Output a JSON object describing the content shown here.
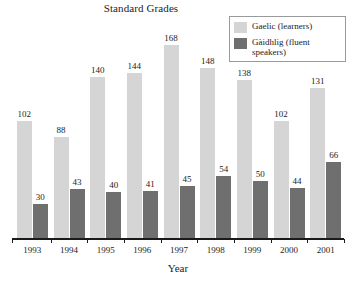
{
  "chart_data": {
    "type": "bar",
    "title": "Standard Grades",
    "xlabel": "Year",
    "ylabel": "",
    "categories": [
      "1993",
      "1994",
      "1995",
      "1996",
      "1997",
      "1998",
      "1999",
      "2000",
      "2001"
    ],
    "series": [
      {
        "name": "Gaelic (learners)",
        "color": "#d5d5d5",
        "values": [
          102,
          88,
          140,
          144,
          168,
          148,
          138,
          102,
          131
        ]
      },
      {
        "name": "Gàidhlig (fluent speakers)",
        "color": "#6f6f6f",
        "values": [
          30,
          43,
          40,
          41,
          45,
          54,
          50,
          44,
          66
        ]
      }
    ],
    "ylim": [
      0,
      190
    ],
    "grid": false,
    "legend_position": "top-right",
    "data_labels": true
  },
  "legend": {
    "entries": [
      {
        "label": "Gaelic (learners)",
        "swatch": "#d5d5d5"
      },
      {
        "label": "Gàidhlig (fluent speakers)",
        "swatch": "#6f6f6f"
      }
    ]
  }
}
